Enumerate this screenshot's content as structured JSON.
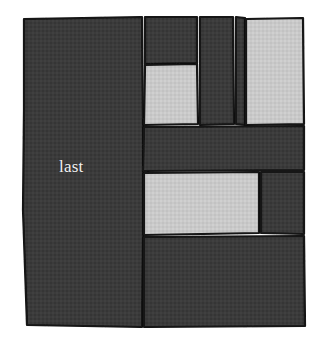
{
  "figure": {
    "title": "last",
    "background_color": "#ffffff",
    "canvas": {
      "width": 320,
      "height": 346
    },
    "style": {
      "dark_fill": "#3b3b3b",
      "light_fill": "#c9c9c9",
      "stroke_color": "#121212",
      "stroke_width": 2.2,
      "texture": "woven-noise",
      "label_color": "#f2f2f2"
    },
    "labels": [
      {
        "text": "last",
        "x": 59,
        "y": 158,
        "color": "#f2f2f2",
        "size": 17
      }
    ],
    "tiles": [
      {
        "id": "tile-left-large",
        "name": "last",
        "fill": "dark",
        "label": "last",
        "points": "24,19 142,17 143,127 143,170 143,236 142,327 27,325 23,210 24,110"
      },
      {
        "id": "tile-top-inner-dark",
        "name": "top-inner-dark",
        "fill": "dark",
        "label": "",
        "points": "145,17 197,17 197,63 145,64"
      },
      {
        "id": "tile-top-inner-light",
        "name": "top-inner-light",
        "fill": "light",
        "label": "",
        "points": "145,65 197,64 198,124 144,125"
      },
      {
        "id": "tile-top-middle-dark",
        "name": "top-middle-dark",
        "fill": "dark",
        "label": "",
        "points": "200,17 233,17 234,124 200,125"
      },
      {
        "id": "tile-top-right-light",
        "name": "top-right-light",
        "fill": "light",
        "label": "",
        "points": "246,19 303,18 304,124 246,125"
      },
      {
        "id": "tile-top-right-gap-dark",
        "name": "top-right-gap-dark",
        "fill": "dark",
        "label": "",
        "points": "236,17 245,18 245,125 236,124"
      },
      {
        "id": "tile-middle-band-dark",
        "name": "middle-band-dark",
        "fill": "dark",
        "label": "",
        "points": "144,127 304,126 304,170 143,171"
      },
      {
        "id": "tile-lower-light",
        "name": "lower-light",
        "fill": "light",
        "label": "",
        "points": "144,173 259,172 259,233 144,235"
      },
      {
        "id": "tile-lower-right-dark",
        "name": "lower-right-dark",
        "fill": "dark",
        "label": "",
        "points": "261,172 304,172 304,234 261,233"
      },
      {
        "id": "tile-bottom-dark",
        "name": "bottom-dark",
        "fill": "dark",
        "label": "",
        "points": "144,237 304,236 305,326 144,327"
      }
    ]
  }
}
